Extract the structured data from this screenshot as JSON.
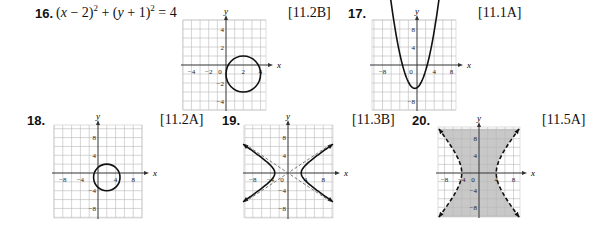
{
  "problems": [
    {
      "number": "16.",
      "equation": {
        "p1": "(",
        "x": "x",
        "p2": " − 2)",
        "sup1": "2",
        "p3": " + (",
        "y": "y",
        "p4": " + 1)",
        "sup2": "2",
        "p5": " = 4"
      },
      "reference": "[11.2B]"
    },
    {
      "number": "17.",
      "reference": "[11.1A]"
    },
    {
      "number": "18.",
      "reference": "[11.2A]"
    },
    {
      "number": "19.",
      "reference": "[11.3B]"
    },
    {
      "number": "20.",
      "reference": "[11.5A]"
    }
  ],
  "chart_data": [
    {
      "id": "graph-16",
      "type": "line",
      "title": "Circle (x − 2)^2 + (y + 1)^2 = 4",
      "xlabel": "x",
      "ylabel": "y",
      "xlim": [
        -5,
        4.6
      ],
      "ylim": [
        -5,
        5
      ],
      "x_ticks": [
        -4,
        -2,
        0,
        2,
        4
      ],
      "x_tick_labels": [
        "−4",
        "−2",
        "0",
        "2",
        "4"
      ],
      "y_ticks": [
        4,
        2,
        -2,
        -4
      ],
      "y_tick_labels": [
        "4",
        "2",
        "−2",
        "−4"
      ],
      "grid": true,
      "grid_step": 1,
      "curves": [
        {
          "kind": "circle",
          "center": [
            2,
            -1
          ],
          "radius": 2,
          "style": "solid"
        }
      ]
    },
    {
      "id": "graph-17",
      "type": "line",
      "title": "Parabola",
      "xlabel": "x",
      "ylabel": "y",
      "xlim": [
        -10,
        9.5
      ],
      "ylim": [
        -10,
        10
      ],
      "x_ticks": [
        -8,
        0,
        4,
        8
      ],
      "x_tick_labels": [
        "−8",
        "0",
        "4",
        "8"
      ],
      "y_ticks": [
        8,
        4,
        -8
      ],
      "y_tick_labels": [
        "8",
        "4",
        "−8"
      ],
      "grid": true,
      "grid_step": 2,
      "curves": [
        {
          "kind": "parabola",
          "vertex": [
            -0.5,
            -5.2
          ],
          "a": 0.63,
          "x_range": [
            -6.4,
            5.4
          ],
          "style": "solid",
          "arrows": true
        }
      ]
    },
    {
      "id": "graph-18",
      "type": "line",
      "title": "Circle",
      "xlabel": "x",
      "ylabel": "y",
      "xlim": [
        -10,
        10
      ],
      "ylim": [
        -10,
        11
      ],
      "x_ticks": [
        -8,
        -4,
        4,
        8
      ],
      "x_tick_labels": [
        "−8",
        "−4",
        "4",
        "8"
      ],
      "y_ticks": [
        8,
        4,
        -4,
        -8
      ],
      "y_tick_labels": [
        "8",
        "4",
        "−4",
        "−8"
      ],
      "grid": true,
      "grid_step": 2,
      "curves": [
        {
          "kind": "circle",
          "center": [
            2,
            -1
          ],
          "radius": 3,
          "style": "solid"
        }
      ]
    },
    {
      "id": "graph-19",
      "type": "line",
      "title": "Hyperbola x^2/9 − y^2/4 = 1 with asymptotes",
      "xlabel": "x",
      "ylabel": "y",
      "xlim": [
        -10,
        10
      ],
      "ylim": [
        -10,
        11
      ],
      "x_ticks": [
        -8,
        -4,
        0,
        4,
        8
      ],
      "x_tick_labels": [
        "−8",
        "−4",
        "0",
        "4",
        "8"
      ],
      "y_ticks": [
        8,
        4,
        -4,
        -8
      ],
      "y_tick_labels": [
        "8",
        "4",
        "−4",
        "−8"
      ],
      "grid": true,
      "grid_step": 2,
      "curves": [
        {
          "kind": "hyperbola-x",
          "a": 3,
          "b": 2,
          "y_range": [
            -6.5,
            6.5
          ],
          "style": "solid",
          "arrows": true
        },
        {
          "kind": "asymptotes",
          "slope": 0.6667,
          "x_range": [
            -9.8,
            9.8
          ],
          "style": "dashed"
        }
      ]
    },
    {
      "id": "graph-20",
      "type": "area",
      "title": "Hyperbola inequality region (shaded between branches)",
      "xlabel": "x",
      "ylabel": "y",
      "xlim": [
        -9.5,
        9.5
      ],
      "ylim": [
        -10.5,
        10.5
      ],
      "x_ticks": [
        -8,
        -4,
        0,
        4,
        8
      ],
      "x_tick_labels": [
        "−8",
        "−4",
        "0",
        "4",
        "8"
      ],
      "y_ticks": [
        8,
        4,
        -4,
        -8
      ],
      "y_tick_labels": [
        "8",
        "4",
        "−4",
        "−8"
      ],
      "grid": true,
      "grid_step": 2,
      "curves": [
        {
          "kind": "hyperbola-x",
          "a": 4,
          "b": 4.9,
          "y_range": [
            -10.3,
            10.3
          ],
          "style": "dashed",
          "arrows": true,
          "shade_between": true
        }
      ],
      "shade_color": "#c8c8c8"
    }
  ],
  "layout": {
    "graph_boxes": [
      {
        "left": 183,
        "top": 20,
        "width": 83,
        "height": 90,
        "origin_x": 226,
        "origin_y": 65
      },
      {
        "left": 372,
        "top": 20,
        "width": 84,
        "height": 90,
        "origin_x": 417,
        "origin_y": 65
      },
      {
        "left": 54,
        "top": 125,
        "width": 88,
        "height": 93,
        "origin_x": 98,
        "origin_y": 173
      },
      {
        "left": 245,
        "top": 125,
        "width": 88,
        "height": 93,
        "origin_x": 288,
        "origin_y": 173
      },
      {
        "left": 438,
        "top": 127,
        "width": 82,
        "height": 90,
        "origin_x": 479,
        "origin_y": 173
      }
    ]
  }
}
